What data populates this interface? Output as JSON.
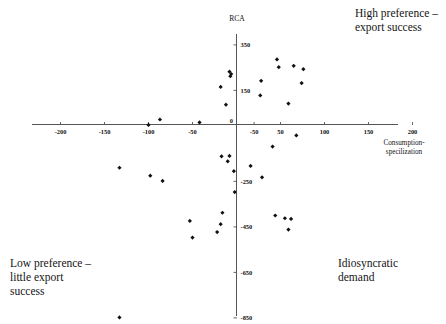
{
  "chart_data": {
    "type": "scatter",
    "title": "",
    "xlabel": "Consumption-\nspecilization",
    "ylabel": "RCA",
    "xlim": [
      -225,
      215
    ],
    "ylim": [
      -900,
      390
    ],
    "grid": false,
    "legend": null,
    "x_ticks": [
      -200,
      -150,
      -100,
      -50,
      0,
      -50,
      50,
      100,
      150,
      200
    ],
    "x_tick_labels": [
      "-200",
      "-150",
      "-100",
      "-50",
      "0",
      "-50",
      "50",
      "100",
      "150",
      "200"
    ],
    "y_ticks": [
      350,
      150,
      0,
      -250,
      -450,
      -650,
      -850
    ],
    "y_tick_labels": [
      "350",
      "150",
      "0",
      "-250",
      "-450",
      "-650",
      "-850"
    ],
    "marker": "diamond",
    "marker_color": "#111111",
    "points": [
      {
        "x": -8,
        "y": 232
      },
      {
        "x": -6,
        "y": 222
      },
      {
        "x": -7,
        "y": 212
      },
      {
        "x": 46,
        "y": 286
      },
      {
        "x": 48,
        "y": 252
      },
      {
        "x": 65,
        "y": 258
      },
      {
        "x": 76,
        "y": 243
      },
      {
        "x": 28,
        "y": 192
      },
      {
        "x": 74,
        "y": 182
      },
      {
        "x": -18,
        "y": 165
      },
      {
        "x": 27,
        "y": 128
      },
      {
        "x": 59,
        "y": 92
      },
      {
        "x": -12,
        "y": 87
      },
      {
        "x": -87,
        "y": 22
      },
      {
        "x": -100,
        "y": -2
      },
      {
        "x": -42,
        "y": 9
      },
      {
        "x": 68,
        "y": -48
      },
      {
        "x": 41,
        "y": -97
      },
      {
        "x": -17,
        "y": -140
      },
      {
        "x": -8,
        "y": -138
      },
      {
        "x": -10,
        "y": -162
      },
      {
        "x": -133,
        "y": -190
      },
      {
        "x": 16,
        "y": -182
      },
      {
        "x": -98,
        "y": -225
      },
      {
        "x": -3,
        "y": -205
      },
      {
        "x": 29,
        "y": -232
      },
      {
        "x": -84,
        "y": -248
      },
      {
        "x": -2,
        "y": -297
      },
      {
        "x": -16,
        "y": -388
      },
      {
        "x": 44,
        "y": -400
      },
      {
        "x": 55,
        "y": -412
      },
      {
        "x": 62,
        "y": -415
      },
      {
        "x": -53,
        "y": -424
      },
      {
        "x": -18,
        "y": -438
      },
      {
        "x": 59,
        "y": -462
      },
      {
        "x": -22,
        "y": -473
      },
      {
        "x": -50,
        "y": -497
      },
      {
        "x": -133,
        "y": -848
      }
    ]
  },
  "annotations": {
    "top_right": "High preference –\nexport success",
    "bottom_left": "Low preference –\nlittle export\nsuccess",
    "bottom_right": "Idiosyncratic\ndemand"
  }
}
